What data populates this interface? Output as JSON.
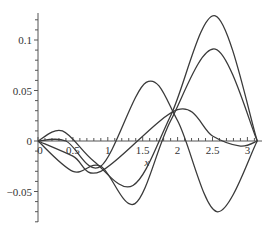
{
  "chart_data": {
    "type": "line",
    "title": "",
    "xlabel": "x",
    "ylabel": "",
    "xlim": [
      0,
      3.1416
    ],
    "ylim": [
      -0.08,
      0.125
    ],
    "grid": false,
    "legend": null,
    "x_ticks": [
      "0",
      "0.5",
      "1",
      "1.5",
      "2",
      "2.5",
      "3"
    ],
    "y_ticks": [
      "0.1",
      "0.05",
      "0",
      "-0.05"
    ],
    "series": [
      {
        "name": "curve-1",
        "x": [
          0,
          0.35,
          0.8,
          1.36,
          1.9,
          2.54,
          3.1416
        ],
        "values": [
          0,
          0.01,
          -0.02,
          -0.044,
          0.025,
          0.124,
          0
        ]
      },
      {
        "name": "curve-2",
        "x": [
          0,
          0.5,
          0.9,
          1.39,
          1.9,
          2.54,
          3.1416
        ],
        "values": [
          0,
          -0.03,
          -0.025,
          -0.062,
          0.02,
          0.091,
          0
        ]
      },
      {
        "name": "curve-3",
        "x": [
          0,
          0.4,
          0.9,
          1.55,
          2.0,
          2.56,
          3.1416
        ],
        "values": [
          0,
          0.0,
          -0.025,
          0.058,
          0.02,
          -0.07,
          0
        ]
      },
      {
        "name": "curve-4",
        "x": [
          0,
          0.5,
          0.9,
          2.0,
          2.5,
          2.9,
          3.1416
        ],
        "values": [
          0,
          -0.015,
          -0.03,
          0.031,
          0.005,
          -0.005,
          0
        ]
      }
    ]
  }
}
